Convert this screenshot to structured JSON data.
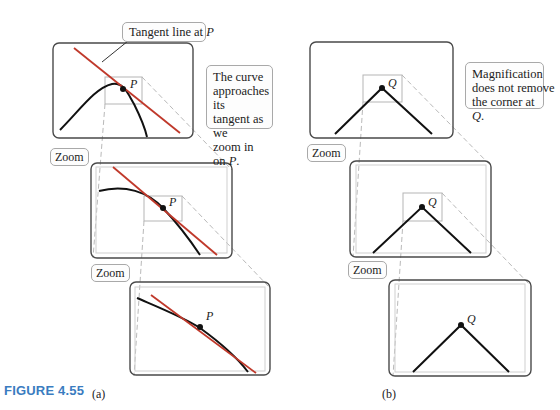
{
  "figure": {
    "caption": "FIGURE 4.55",
    "accent_color": "#3a7cc0",
    "tangent_color": "#c0392b",
    "curve_color": "#111111"
  },
  "panel_a": {
    "sublabel": "(a)",
    "tangent_label_prefix": "Tangent line at ",
    "tangent_label_point": "P",
    "callout_lines": [
      "The curve",
      "approaches its",
      "tangent as we",
      "zoom in on "
    ],
    "callout_point": "P",
    "callout_suffix": ".",
    "point_label": "P",
    "zoom_labels": [
      "Zoom",
      "Zoom"
    ]
  },
  "panel_b": {
    "sublabel": "(b)",
    "callout_lines": [
      "Magnification",
      "does not remove",
      "the corner at "
    ],
    "callout_point": "Q",
    "callout_suffix": ".",
    "point_label": "Q",
    "zoom_labels": [
      "Zoom",
      "Zoom"
    ]
  }
}
